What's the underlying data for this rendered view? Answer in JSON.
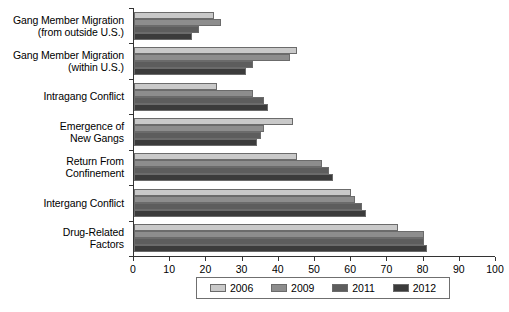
{
  "chart_data": {
    "type": "bar",
    "orientation": "horizontal",
    "title": "",
    "subtitle": "",
    "xlabel": "",
    "ylabel": "",
    "xlim": [
      0,
      100
    ],
    "xticks": [
      0,
      10,
      20,
      30,
      40,
      50,
      60,
      70,
      80,
      90,
      100
    ],
    "xtick_labels": [
      "0",
      "10",
      "20",
      "30",
      "40",
      "50",
      "60",
      "70",
      "80",
      "90",
      "100"
    ],
    "grid": false,
    "legend_position": "bottom",
    "categories": [
      "Gang Member Migration (from outside U.S.)",
      "Gang Member Migration (within U.S.)",
      "Intragang Conflict",
      "Emergence of New Gangs",
      "Return From Confinement",
      "Intergang Conflict",
      "Drug-Related Factors"
    ],
    "category_lines": [
      [
        "Gang Member Migration",
        "(from outside U.S.)"
      ],
      [
        "Gang Member Migration",
        "(within U.S.)"
      ],
      [
        "Intragang Conflict"
      ],
      [
        "Emergence of",
        "New Gangs"
      ],
      [
        "Return From",
        "Confinement"
      ],
      [
        "Intergang Conflict"
      ],
      [
        "Drug-Related",
        "Factors"
      ]
    ],
    "series": [
      {
        "name": "2006",
        "color": "#c9c9c9",
        "values": [
          22,
          45,
          23,
          44,
          45,
          60,
          73
        ]
      },
      {
        "name": "2009",
        "color": "#8d8d8d",
        "values": [
          24,
          43,
          33,
          36,
          52,
          61,
          80
        ]
      },
      {
        "name": "2011",
        "color": "#5d5d5d",
        "values": [
          18,
          33,
          36,
          35,
          54,
          63,
          80
        ]
      },
      {
        "name": "2012",
        "color": "#3b3b3b",
        "values": [
          16,
          31,
          37,
          34,
          55,
          64,
          81
        ]
      }
    ]
  },
  "legend": {
    "items": [
      {
        "label": "2006",
        "color": "#c9c9c9"
      },
      {
        "label": "2009",
        "color": "#8d8d8d"
      },
      {
        "label": "2011",
        "color": "#5d5d5d"
      },
      {
        "label": "2012",
        "color": "#3b3b3b"
      }
    ]
  }
}
